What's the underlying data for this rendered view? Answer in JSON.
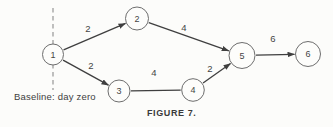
{
  "figure": {
    "caption": "FIGURE 7.",
    "baseline_label": "Baseline: day zero"
  },
  "diagram": {
    "type": "activity-network",
    "colors": {
      "background": "#fcfcfa",
      "edge_line": "#3f3f3f",
      "node_stroke": "#6e6e6e",
      "node_fill": "#fdfdfb",
      "dashed_line": "#8c8c8c",
      "text": "#454545"
    },
    "dashed_line": {
      "x": 53,
      "y1": 8,
      "y2": 90
    },
    "nodes": [
      {
        "id": "1",
        "x": 53,
        "y": 54.5,
        "r": 10.5
      },
      {
        "id": "2",
        "x": 137,
        "y": 18.5,
        "r": 11.5
      },
      {
        "id": "3",
        "x": 119,
        "y": 91,
        "r": 11
      },
      {
        "id": "4",
        "x": 193,
        "y": 90,
        "r": 11.3
      },
      {
        "id": "5",
        "x": 242,
        "y": 55.5,
        "r": 13
      },
      {
        "id": "6",
        "x": 308,
        "y": 54,
        "r": 12.5
      }
    ],
    "edges": [
      {
        "from": "1",
        "to": "2",
        "weight": "2",
        "arrow": true,
        "label_x": 88,
        "label_y": 29
      },
      {
        "from": "1",
        "to": "3",
        "weight": "2",
        "arrow": true,
        "label_x": 91,
        "label_y": 66
      },
      {
        "from": "2",
        "to": "5",
        "weight": "4",
        "arrow": true,
        "label_x": 184,
        "label_y": 28
      },
      {
        "from": "3",
        "to": "4",
        "weight": "4",
        "arrow": false,
        "label_x": 154,
        "label_y": 73
      },
      {
        "from": "4",
        "to": "5",
        "weight": "2",
        "arrow": true,
        "label_x": 210,
        "label_y": 69
      },
      {
        "from": "5",
        "to": "6",
        "weight": "6",
        "arrow": true,
        "label_x": 273,
        "label_y": 39
      }
    ]
  }
}
